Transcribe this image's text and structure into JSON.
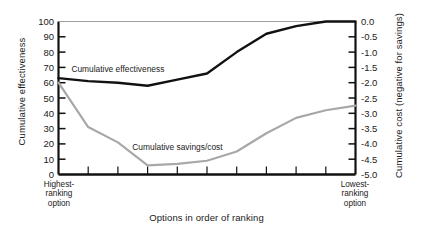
{
  "chart_data": {
    "type": "line",
    "title": "",
    "xlabel": "Options in order of ranking",
    "ylabel": "Cumulative effectiveness",
    "ylabel_right": "Cumulative cost (negative for savings)",
    "grid": false,
    "legend_position": "inline-annotation",
    "x_axis": {
      "left_category": "Highest-\nranking\noption",
      "left_category_lines": [
        "Highest-",
        "ranking",
        "option"
      ],
      "right_category": "Lowest-\nranking\noption",
      "right_category_lines": [
        "Lowest-",
        "ranking",
        "option"
      ],
      "tick_count_interior": 9,
      "xlim": [
        0,
        10
      ]
    },
    "y_axis_left": {
      "label": "Cumulative effectiveness",
      "ylim": [
        0,
        100
      ],
      "tick_step": 10,
      "ticks": [
        0,
        10,
        20,
        30,
        40,
        50,
        60,
        70,
        80,
        90,
        100
      ],
      "tick_labels": [
        "0",
        "10",
        "20",
        "30",
        "40",
        "50",
        "60",
        "70",
        "80",
        "90",
        "100"
      ]
    },
    "y_axis_right": {
      "label": "Cumulative cost (negative for savings)",
      "ylim": [
        -5.0,
        0.0
      ],
      "tick_step": 0.5,
      "ticks": [
        0.0,
        -0.5,
        -1.0,
        -1.5,
        -2.0,
        -2.5,
        -3.0,
        -3.5,
        -4.0,
        -4.5,
        -5.0
      ],
      "tick_labels": [
        "0.0",
        "-0.5",
        "-1.0",
        "-1.5",
        "-2.0",
        "-2.5",
        "-3.0",
        "-3.5",
        "-4.0",
        "-4.5",
        "-5.0"
      ]
    },
    "x": [
      0,
      1,
      2,
      3,
      4,
      5,
      6,
      7,
      8,
      9,
      10
    ],
    "series": [
      {
        "name": "Cumulative effectiveness",
        "axis": "left",
        "color": "#111111",
        "width": 2.4,
        "label_x": 2.0,
        "label_y": 69,
        "values": [
          63,
          61,
          60,
          58,
          62,
          66,
          80,
          92,
          97,
          100,
          100
        ]
      },
      {
        "name": "Cumulative savings/cost",
        "axis": "right",
        "color": "#a8a8a8",
        "width": 2.2,
        "label_x": 4.0,
        "label_y": 18,
        "values_left_scale": [
          60,
          31,
          21,
          6,
          7,
          9,
          15,
          27,
          37,
          42,
          45
        ],
        "values": [
          -2.0,
          -3.45,
          -3.95,
          -4.7,
          -4.65,
          -4.55,
          -4.25,
          -3.65,
          -3.15,
          -2.9,
          -2.75
        ]
      }
    ],
    "annotations": [
      {
        "text": "Cumulative effectiveness",
        "series": "effectiveness"
      },
      {
        "text": "Cumulative savings/cost",
        "series": "savings-cost"
      }
    ]
  }
}
